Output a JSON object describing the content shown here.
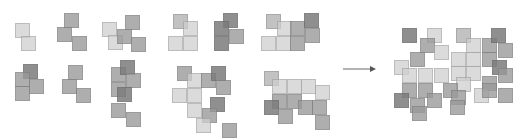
{
  "diagram": {
    "colors": {
      "light": "#cfcfcf",
      "mid": "#9a9a9a",
      "dark": "#7c7c7c",
      "midlight": "#b4b4b4",
      "arrow": "#555555"
    },
    "tile_size": 15,
    "arrow": {
      "from": [
        343,
        69
      ],
      "to": [
        376,
        69
      ]
    },
    "groups": [
      {
        "name": "cluster-1",
        "tiles": [
          [
            15,
            23,
            "light"
          ],
          [
            21,
            36,
            "light"
          ]
        ]
      },
      {
        "name": "cluster-2",
        "tiles": [
          [
            64,
            13,
            "mid"
          ],
          [
            57,
            27,
            "mid"
          ],
          [
            72,
            36,
            "mid"
          ]
        ]
      },
      {
        "name": "cluster-3",
        "tiles": [
          [
            102,
            22,
            "light"
          ],
          [
            108,
            35,
            "light"
          ],
          [
            117,
            29,
            "mid"
          ],
          [
            125,
            15,
            "mid"
          ],
          [
            131,
            37,
            "mid"
          ]
        ]
      },
      {
        "name": "cluster-4",
        "tiles": [
          [
            173,
            14,
            "midlight"
          ],
          [
            183,
            21,
            "light"
          ],
          [
            168,
            36,
            "light"
          ],
          [
            183,
            36,
            "light"
          ]
        ]
      },
      {
        "name": "cluster-5",
        "tiles": [
          [
            223,
            13,
            "dark"
          ],
          [
            214,
            21,
            "dark"
          ],
          [
            229,
            29,
            "mid"
          ],
          [
            214,
            36,
            "dark"
          ]
        ]
      },
      {
        "name": "cluster-6",
        "tiles": [
          [
            266,
            14,
            "midlight"
          ],
          [
            277,
            21,
            "light"
          ],
          [
            261,
            36,
            "light"
          ],
          [
            276,
            36,
            "light"
          ],
          [
            290,
            21,
            "mid"
          ],
          [
            304,
            13,
            "dark"
          ],
          [
            305,
            28,
            "mid"
          ],
          [
            290,
            36,
            "mid"
          ]
        ]
      },
      {
        "name": "cluster-7",
        "tiles": [
          [
            23,
            64,
            "dark"
          ],
          [
            15,
            72,
            "mid"
          ],
          [
            29,
            79,
            "mid"
          ],
          [
            15,
            86,
            "mid"
          ]
        ]
      },
      {
        "name": "cluster-8",
        "tiles": [
          [
            68,
            65,
            "mid"
          ],
          [
            62,
            79,
            "mid"
          ],
          [
            76,
            88,
            "mid"
          ]
        ]
      },
      {
        "name": "cluster-9",
        "tiles": [
          [
            111,
            67,
            "mid"
          ],
          [
            111,
            82,
            "mid"
          ],
          [
            120,
            60,
            "dark"
          ],
          [
            126,
            73,
            "mid"
          ],
          [
            117,
            87,
            "dark"
          ],
          [
            111,
            103,
            "mid"
          ],
          [
            126,
            112,
            "mid"
          ]
        ]
      },
      {
        "name": "cluster-10",
        "tiles": [
          [
            177,
            66,
            "mid"
          ],
          [
            187,
            73,
            "light"
          ],
          [
            172,
            88,
            "light"
          ],
          [
            187,
            88,
            "light"
          ],
          [
            201,
            73,
            "mid"
          ],
          [
            211,
            66,
            "dark"
          ],
          [
            216,
            80,
            "mid"
          ],
          [
            210,
            97,
            "dark"
          ],
          [
            187,
            103,
            "light"
          ],
          [
            202,
            108,
            "mid"
          ],
          [
            196,
            118,
            "light"
          ],
          [
            222,
            123,
            "mid"
          ]
        ]
      },
      {
        "name": "cluster-11",
        "tiles": [
          [
            264,
            71,
            "midlight"
          ],
          [
            272,
            79,
            "light"
          ],
          [
            287,
            79,
            "light"
          ],
          [
            301,
            79,
            "light"
          ],
          [
            315,
            85,
            "light"
          ],
          [
            272,
            94,
            "mid"
          ],
          [
            287,
            94,
            "mid"
          ],
          [
            264,
            100,
            "dark"
          ],
          [
            298,
            100,
            "mid"
          ],
          [
            278,
            109,
            "mid"
          ],
          [
            312,
            100,
            "mid"
          ],
          [
            315,
            115,
            "mid"
          ]
        ]
      },
      {
        "name": "composite",
        "tiles": [
          [
            402,
            28,
            "dark"
          ],
          [
            427,
            28,
            "light"
          ],
          [
            420,
            38,
            "mid"
          ],
          [
            434,
            45,
            "light"
          ],
          [
            456,
            28,
            "midlight"
          ],
          [
            466,
            38,
            "light"
          ],
          [
            482,
            38,
            "mid"
          ],
          [
            491,
            28,
            "dark"
          ],
          [
            498,
            43,
            "mid"
          ],
          [
            410,
            52,
            "mid"
          ],
          [
            394,
            60,
            "light"
          ],
          [
            402,
            68,
            "light"
          ],
          [
            418,
            68,
            "light"
          ],
          [
            434,
            68,
            "light"
          ],
          [
            451,
            52,
            "light"
          ],
          [
            466,
            52,
            "light"
          ],
          [
            482,
            52,
            "mid"
          ],
          [
            492,
            60,
            "dark"
          ],
          [
            498,
            68,
            "mid"
          ],
          [
            451,
            66,
            "light"
          ],
          [
            466,
            66,
            "light"
          ],
          [
            456,
            77,
            "light"
          ],
          [
            482,
            76,
            "mid"
          ],
          [
            402,
            83,
            "mid"
          ],
          [
            418,
            83,
            "mid"
          ],
          [
            394,
            93,
            "dark"
          ],
          [
            410,
            98,
            "mid"
          ],
          [
            427,
            93,
            "mid"
          ],
          [
            443,
            83,
            "mid"
          ],
          [
            451,
            90,
            "mid"
          ],
          [
            474,
            88,
            "light"
          ],
          [
            482,
            83,
            "mid"
          ],
          [
            498,
            88,
            "mid"
          ],
          [
            450,
            100,
            "mid"
          ],
          [
            412,
            106,
            "mid"
          ]
        ]
      }
    ]
  }
}
